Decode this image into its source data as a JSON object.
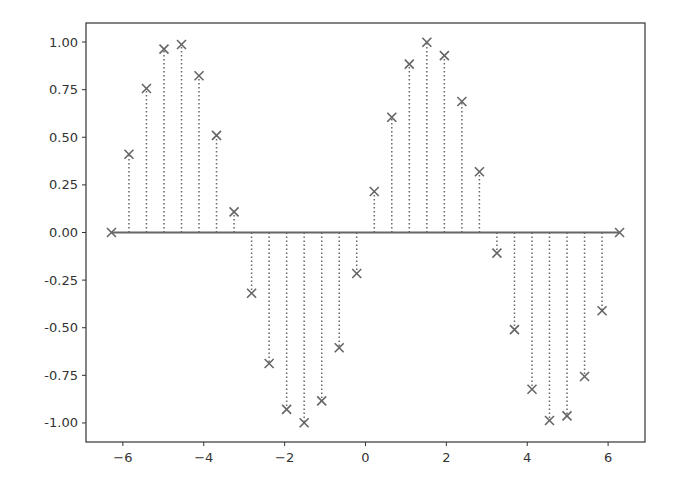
{
  "chart_data": {
    "type": "stem",
    "title": "",
    "xlabel": "",
    "ylabel": "",
    "xlim": [
      -6.912,
      6.912
    ],
    "ylim": [
      -1.1,
      1.1
    ],
    "grid": false,
    "legend": null,
    "marker": "x",
    "stem_linestyle": "dotted",
    "baseline": 0,
    "color": "#666666",
    "x_ticks": [
      -6,
      -4,
      -2,
      0,
      2,
      4,
      6
    ],
    "x_tick_labels": [
      "−6",
      "−4",
      "−2",
      "0",
      "2",
      "4",
      "6"
    ],
    "y_ticks": [
      1.0,
      0.75,
      0.5,
      0.25,
      0.0,
      -0.25,
      -0.5,
      -0.75,
      -1.0
    ],
    "y_tick_labels": [
      "1.00",
      "0.75",
      "0.50",
      "0.25",
      "0.00",
      "-0.25",
      "-0.50",
      "-0.75",
      "-1.00"
    ],
    "x": [
      -6.283,
      -5.85,
      -5.417,
      -4.983,
      -4.55,
      -4.117,
      -3.684,
      -3.25,
      -2.817,
      -2.383,
      -1.95,
      -1.517,
      -1.083,
      -0.65,
      -0.217,
      0.217,
      0.65,
      1.083,
      1.517,
      1.95,
      2.383,
      2.817,
      3.25,
      3.684,
      4.117,
      4.55,
      4.983,
      5.417,
      5.85,
      6.283
    ],
    "values": [
      0.0,
      0.411,
      0.756,
      0.963,
      0.987,
      0.823,
      0.51,
      0.108,
      -0.319,
      -0.688,
      -0.929,
      -0.999,
      -0.884,
      -0.605,
      -0.215,
      0.215,
      0.605,
      0.884,
      0.999,
      0.929,
      0.688,
      0.319,
      -0.108,
      -0.51,
      -0.823,
      -0.987,
      -0.963,
      -0.756,
      -0.411,
      0.0
    ]
  }
}
